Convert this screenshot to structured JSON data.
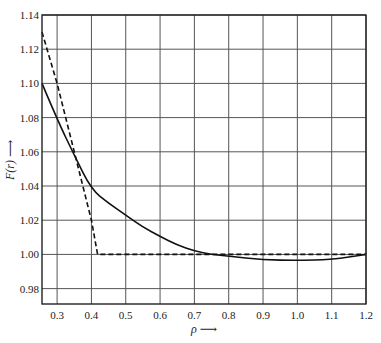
{
  "chart_data": {
    "type": "line",
    "title": "",
    "xlabel": "ρ",
    "ylabel": "F(r)",
    "xlim": [
      0.256,
      1.2
    ],
    "ylim": [
      0.971,
      1.14
    ],
    "grid": true,
    "legend": null,
    "x_ticks": [
      "0.3",
      "0.4",
      "0.5",
      "0.6",
      "0.7",
      "0.8",
      "0.9",
      "1.0",
      "1.1",
      "1.2"
    ],
    "y_ticks": [
      "0.98",
      "1.00",
      "1.02",
      "1.04",
      "1.06",
      "1.08",
      "1.10",
      "1.12",
      "1.14"
    ],
    "series": [
      {
        "name": "solid curve",
        "style": "solid",
        "x": [
          0.256,
          0.3,
          0.35,
          0.4,
          0.45,
          0.5,
          0.55,
          0.6,
          0.65,
          0.7,
          0.75,
          0.8,
          0.9,
          1.0,
          1.1,
          1.15,
          1.2
        ],
        "y": [
          1.1,
          1.079,
          1.058,
          1.038,
          1.03,
          1.023,
          1.016,
          1.0105,
          1.0055,
          1.002,
          1.0,
          0.999,
          0.9968,
          0.9965,
          0.997,
          0.9985,
          1.0
        ]
      },
      {
        "name": "dashed curve",
        "style": "dashed",
        "x": [
          0.256,
          0.3,
          0.35,
          0.4,
          0.418,
          0.6,
          0.8,
          1.0,
          1.2
        ],
        "y": [
          1.13,
          1.1,
          1.06,
          1.02,
          1.0,
          1.0,
          1.0,
          1.0,
          1.0
        ]
      }
    ]
  },
  "axes": {
    "x_label": "ρ ⟶",
    "y_label": "F(r) ⟶"
  }
}
